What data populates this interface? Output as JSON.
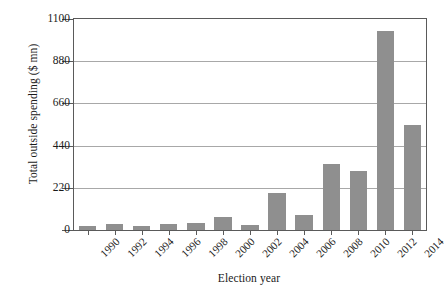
{
  "chart_data": {
    "type": "bar",
    "title": "",
    "xlabel": "Election year",
    "ylabel": "Total outside spending ($ mn)",
    "categories": [
      "1990",
      "1992",
      "1994",
      "1996",
      "1998",
      "2000",
      "2002",
      "2004",
      "2006",
      "2008",
      "2010",
      "2012",
      "2014"
    ],
    "values": [
      19,
      31,
      19,
      33,
      34,
      68,
      26,
      193,
      78,
      344,
      307,
      1038,
      547
    ],
    "ylim": [
      0,
      1100
    ],
    "yticks": [
      0,
      220,
      440,
      660,
      880,
      1100
    ],
    "ytick_labels": [
      "0",
      "220",
      "440",
      "660",
      "880",
      "1100"
    ],
    "grid": "horizontal",
    "legend": "none",
    "bar_color": "#8f8f8f",
    "axis_color": "#5a5a5a",
    "grid_color": "#a8a8a8",
    "background_color": "#ffffff"
  }
}
